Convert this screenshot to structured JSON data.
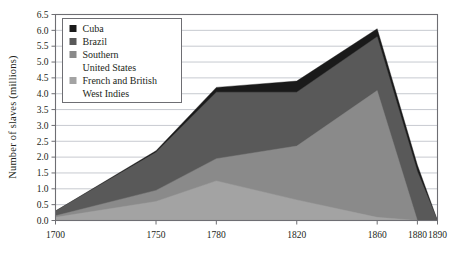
{
  "chart_data": {
    "type": "area",
    "stacked": true,
    "title": "",
    "xlabel": "",
    "ylabel": "Number of slaves (millions)",
    "x": [
      1700,
      1750,
      1780,
      1820,
      1860,
      1880,
      1890
    ],
    "xtick_labels": [
      "1700",
      "1750",
      "1780",
      "1820",
      "1860",
      "1880",
      "1890"
    ],
    "xlim": [
      1700,
      1890
    ],
    "ylim": [
      0.0,
      6.5
    ],
    "ytick_labels": [
      "0.0",
      "0.5",
      "1.0",
      "1.5",
      "2.0",
      "2.5",
      "3.0",
      "3.5",
      "4.0",
      "4.5",
      "5.0",
      "5.5",
      "6.0",
      "6.5"
    ],
    "ytick_values": [
      0.0,
      0.5,
      1.0,
      1.5,
      2.0,
      2.5,
      3.0,
      3.5,
      4.0,
      4.5,
      5.0,
      5.5,
      6.0,
      6.5
    ],
    "grid": "horizontal",
    "legend_position": "upper-left",
    "series": [
      {
        "name": "French and British West Indies",
        "color": "#a3a3a3",
        "values": [
          0.1,
          0.6,
          1.25,
          0.65,
          0.1,
          0.0,
          0.0
        ]
      },
      {
        "name": "Southern United States",
        "color": "#8a8a8a",
        "values": [
          0.05,
          0.35,
          0.7,
          1.7,
          4.0,
          0.0,
          0.0
        ]
      },
      {
        "name": "Brazil",
        "color": "#595959",
        "values": [
          0.15,
          1.2,
          2.1,
          1.7,
          1.7,
          1.55,
          0.0
        ]
      },
      {
        "name": "Cuba",
        "color": "#1a1a1a",
        "values": [
          0.0,
          0.05,
          0.15,
          0.35,
          0.25,
          0.2,
          0.0
        ]
      }
    ],
    "totals": [
      0.3,
      2.2,
      4.2,
      4.4,
      6.05,
      1.75,
      0.0
    ]
  },
  "legend": {
    "items": [
      {
        "label": "Cuba",
        "label2": "",
        "color": "#1a1a1a",
        "swatch_name": "legend-swatch-cuba"
      },
      {
        "label": "Brazil",
        "label2": "",
        "color": "#595959",
        "swatch_name": "legend-swatch-brazil"
      },
      {
        "label": "Southern",
        "label2": "United States",
        "color": "#8a8a8a",
        "swatch_name": "legend-swatch-southern-united-states"
      },
      {
        "label": "French and British",
        "label2": "West Indies",
        "color": "#a3a3a3",
        "swatch_name": "legend-swatch-french-and-british-west-indies"
      }
    ]
  },
  "colors": {
    "frame": "#6e6e73",
    "gridline": "#b9bcc4",
    "text": "#231f20",
    "background": "#ffffff",
    "legend_border": "#6e6e73"
  }
}
